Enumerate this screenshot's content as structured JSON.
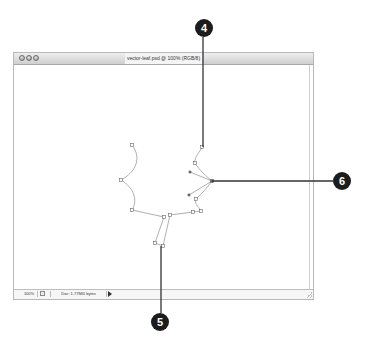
{
  "window": {
    "title": "vector-leaf.psd @ 100% (RGB/8)",
    "traffic_lights": [
      "close",
      "minimize",
      "zoom"
    ]
  },
  "statusbar": {
    "zoom": "100%",
    "icon": "document-info-icon",
    "doc_info": "Doc: 1.77M/0 bytes",
    "menu_arrow": "right-triangle-icon"
  },
  "canvas": {
    "shape": "leaf-vector-path",
    "stroke_color": "#9a9a9a",
    "anchor_points": [
      [
        132,
        145
      ],
      [
        121,
        180
      ],
      [
        132,
        210
      ],
      [
        164,
        217
      ],
      [
        155,
        243
      ],
      [
        163,
        246
      ],
      [
        170,
        215
      ],
      [
        193,
        212
      ],
      [
        201,
        211
      ],
      [
        196,
        199
      ],
      [
        212,
        181
      ],
      [
        202,
        147
      ],
      [
        195,
        163
      ]
    ],
    "handles": [
      [
        190,
        172
      ],
      [
        189,
        195
      ]
    ]
  },
  "callouts": [
    {
      "label": "4",
      "cx": 204,
      "cy": 28,
      "line": [
        [
          203,
          37
        ],
        [
          203,
          147
        ]
      ]
    },
    {
      "label": "6",
      "cx": 342,
      "cy": 181,
      "line": [
        [
          212,
          181
        ],
        [
          333,
          181
        ]
      ]
    },
    {
      "label": "5",
      "cx": 160,
      "cy": 322,
      "line": [
        [
          161,
          246
        ],
        [
          161,
          313
        ]
      ]
    }
  ],
  "colors": {
    "callout_fill": "#1c1c1c",
    "callout_text": "#ffffff",
    "leader_line": "#333333",
    "window_border": "#b8b8b8"
  }
}
